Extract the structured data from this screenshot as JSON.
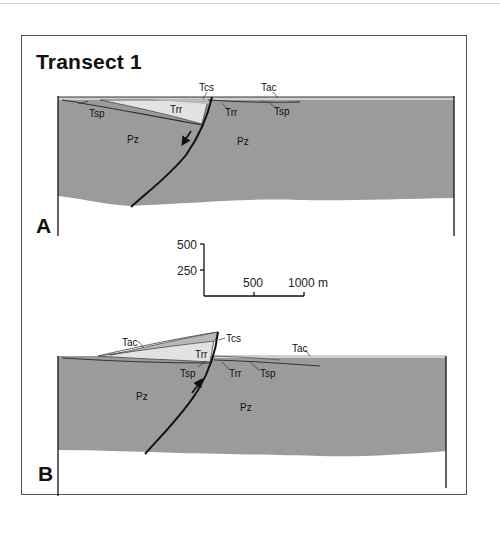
{
  "figure": {
    "title": "Transect 1",
    "colors": {
      "basement": "#9b9b9b",
      "light_unit": "#e2e2e2",
      "mid_unit": "#b8b8b8",
      "line": "#111111"
    }
  },
  "panels": [
    {
      "letter": "A",
      "fault_motion": "normal (down arrow)",
      "labels": {
        "tcs": "Tcs",
        "tac": "Tac",
        "tsp_left": "Tsp",
        "tsp_right": "Tsp",
        "trr_left": "Trr",
        "trr_right": "Trr",
        "pz_left": "Pz",
        "pz_right": "Pz"
      }
    },
    {
      "letter": "B",
      "fault_motion": "reverse (up arrow)",
      "labels": {
        "tac_left": "Tac",
        "tac_right": "Tac",
        "tcs": "Tcs",
        "trr_left": "Trr",
        "trr_right": "Trr",
        "tsp_left": "Tsp",
        "tsp_right": "Tsp",
        "pz_left": "Pz",
        "pz_right": "Pz"
      }
    }
  ],
  "scale_bar": {
    "vertical_ticks": [
      "500",
      "250"
    ],
    "horizontal_ticks": [
      "500",
      "1000 m"
    ]
  }
}
